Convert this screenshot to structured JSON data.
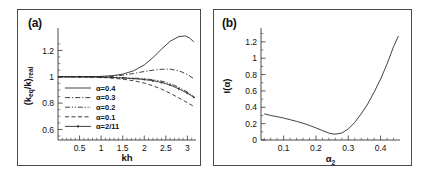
{
  "figure": {
    "background": "#ffffff",
    "frame_color": "#4a4a4a",
    "curve_color": "#2b2b2b"
  },
  "panel_a": {
    "label": "(a)",
    "xlabel": "kh",
    "ylabel_main": "(k",
    "ylabel_sub1": "eq",
    "ylabel_mid": "/k)",
    "ylabel_sub2": "real",
    "xticks": [
      "0.5",
      "1",
      "1.5",
      "2",
      "2.5",
      "3"
    ],
    "yticks": [
      "0.6",
      "0.8",
      "1",
      "1.2"
    ],
    "legend": [
      {
        "label": "α=0.4",
        "style": "solid"
      },
      {
        "label": "α=0.3",
        "style": "dashdot"
      },
      {
        "label": "α=0.2",
        "style": "dashdotdot"
      },
      {
        "label": "α=0.1",
        "style": "dashed"
      },
      {
        "label": "α=2/11",
        "style": "solid-marker"
      }
    ]
  },
  "panel_b": {
    "label": "(b)",
    "xlabel_main": "α",
    "xlabel_sub": "2",
    "ylabel_main": "I(α)",
    "xticks": [
      "0.1",
      "0.2",
      "0.3",
      "0.4"
    ],
    "yticks": [
      "0",
      "0.2",
      "0.4",
      "0.6",
      "0.8",
      "1",
      "1.2"
    ]
  },
  "chart_data": [
    {
      "type": "line",
      "panel": "(a)",
      "title": "",
      "xlabel": "kh",
      "ylabel": "(k_eq/k)_real",
      "xlim": [
        0.0,
        3.2
      ],
      "ylim": [
        0.52,
        1.34
      ],
      "xticks": [
        0.5,
        1.0,
        1.5,
        2.0,
        2.5,
        3.0
      ],
      "yticks": [
        0.6,
        0.8,
        1.0,
        1.2
      ],
      "grid": false,
      "legend_position": "lower-left-inside",
      "series": [
        {
          "name": "α=0.4",
          "style": "solid",
          "x": [
            0.0,
            0.25,
            0.5,
            0.75,
            1.0,
            1.25,
            1.5,
            1.75,
            2.0,
            2.2,
            2.4,
            2.6,
            2.8,
            2.95,
            3.05,
            3.15
          ],
          "y": [
            1.0,
            1.0,
            1.0,
            1.001,
            1.003,
            1.008,
            1.02,
            1.045,
            1.09,
            1.145,
            1.21,
            1.27,
            1.305,
            1.31,
            1.295,
            1.265
          ]
        },
        {
          "name": "α=0.3",
          "style": "dashdot",
          "x": [
            0.0,
            0.25,
            0.5,
            0.75,
            1.0,
            1.25,
            1.5,
            1.75,
            2.0,
            2.2,
            2.4,
            2.6,
            2.8,
            3.0,
            3.15
          ],
          "y": [
            1.0,
            1.0,
            1.0,
            1.0,
            1.001,
            1.004,
            1.012,
            1.025,
            1.04,
            1.05,
            1.057,
            1.058,
            1.046,
            1.018,
            0.985
          ]
        },
        {
          "name": "α=0.2",
          "style": "dashdotdot",
          "x": [
            0.0,
            0.25,
            0.5,
            0.75,
            1.0,
            1.25,
            1.5,
            1.75,
            2.0,
            2.2,
            2.4,
            2.6,
            2.8,
            3.0,
            3.15
          ],
          "y": [
            1.0,
            1.0,
            1.0,
            0.999,
            0.998,
            0.996,
            0.993,
            0.99,
            0.985,
            0.978,
            0.967,
            0.948,
            0.92,
            0.884,
            0.852
          ]
        },
        {
          "name": "α=0.1",
          "style": "dashed",
          "x": [
            0.0,
            0.25,
            0.5,
            0.75,
            1.0,
            1.25,
            1.5,
            1.75,
            2.0,
            2.2,
            2.4,
            2.6,
            2.8,
            3.0,
            3.15
          ],
          "y": [
            1.0,
            1.0,
            0.999,
            0.998,
            0.995,
            0.99,
            0.982,
            0.97,
            0.952,
            0.932,
            0.906,
            0.875,
            0.84,
            0.803,
            0.775
          ]
        },
        {
          "name": "α=2/11",
          "style": "solid-marker",
          "x": [
            0.0,
            0.25,
            0.5,
            0.75,
            1.0,
            1.25,
            1.5,
            1.75,
            2.0,
            2.2,
            2.4,
            2.6,
            2.8,
            3.0,
            3.15
          ],
          "y": [
            1.0,
            1.0,
            1.0,
            0.999,
            0.997,
            0.995,
            0.991,
            0.986,
            0.979,
            0.97,
            0.957,
            0.937,
            0.909,
            0.875,
            0.845
          ]
        }
      ]
    },
    {
      "type": "line",
      "panel": "(b)",
      "title": "",
      "xlabel": "α₂",
      "ylabel": "I(α)",
      "xlim": [
        0.03,
        0.46
      ],
      "ylim": [
        0.0,
        1.32
      ],
      "xticks": [
        0.1,
        0.2,
        0.3,
        0.4
      ],
      "yticks": [
        0,
        0.2,
        0.4,
        0.6,
        0.8,
        1.0,
        1.2
      ],
      "grid": false,
      "legend_position": "none",
      "series": [
        {
          "name": "I(α)",
          "style": "solid",
          "x": [
            0.04,
            0.06,
            0.08,
            0.1,
            0.12,
            0.14,
            0.16,
            0.18,
            0.2,
            0.22,
            0.24,
            0.25,
            0.26,
            0.28,
            0.3,
            0.32,
            0.34,
            0.36,
            0.38,
            0.4,
            0.42,
            0.44,
            0.455
          ],
          "y": [
            0.32,
            0.3,
            0.285,
            0.268,
            0.248,
            0.228,
            0.205,
            0.178,
            0.148,
            0.115,
            0.085,
            0.075,
            0.072,
            0.085,
            0.135,
            0.215,
            0.32,
            0.44,
            0.585,
            0.745,
            0.93,
            1.14,
            1.27
          ]
        }
      ]
    }
  ]
}
